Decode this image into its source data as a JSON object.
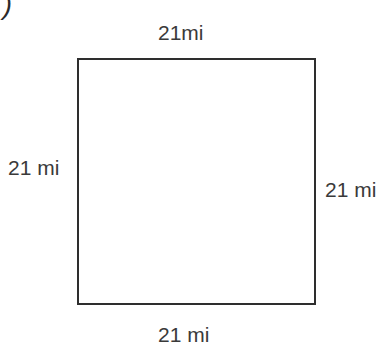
{
  "figure": {
    "item_marker": ")",
    "shape_name": "square",
    "labels": {
      "top": "21mi",
      "left": "21 mi",
      "right": "21 mi",
      "bottom": "21 mi"
    }
  },
  "chart_data": {
    "type": "diagram",
    "shape": "square",
    "title": "",
    "unit": "mi",
    "side_length": 21,
    "sides": [
      {
        "position": "top",
        "label": "21mi",
        "value": 21,
        "unit": "mi"
      },
      {
        "position": "left",
        "label": "21 mi",
        "value": 21,
        "unit": "mi"
      },
      {
        "position": "right",
        "label": "21 mi",
        "value": 21,
        "unit": "mi"
      },
      {
        "position": "bottom",
        "label": "21 mi",
        "value": 21,
        "unit": "mi"
      }
    ],
    "colors": {
      "stroke": "#2e2e2e",
      "fill": "#ffffff",
      "text": "#3a3a3a"
    }
  }
}
